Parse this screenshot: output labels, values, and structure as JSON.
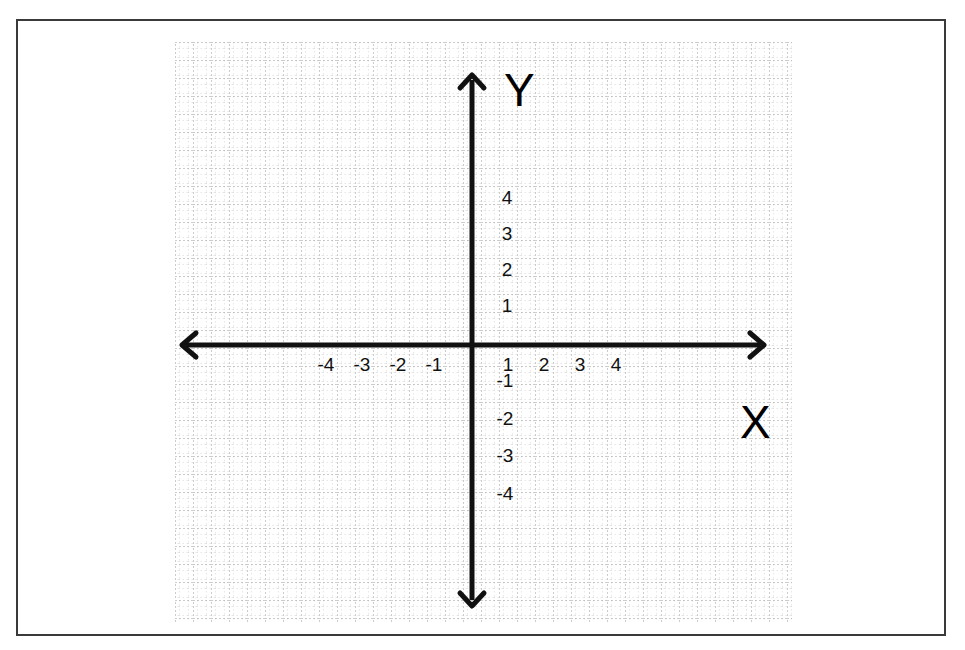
{
  "diagram": {
    "type": "cartesian-coordinate-plane",
    "axes": {
      "x_label": "X",
      "y_label": "Y",
      "x_ticks": [
        "-4",
        "-3",
        "-2",
        "-1",
        "1",
        "2",
        "3",
        "4"
      ],
      "y_ticks": [
        "4",
        "3",
        "2",
        "1",
        "-1",
        "-2",
        "-3",
        "-4"
      ],
      "arrows": "both-ends"
    },
    "grid": {
      "style": "dotted graph paper",
      "color": "#9a9a9a"
    },
    "colors": {
      "axis": "#111111",
      "frame": "#3a3a3a",
      "background": "#ffffff"
    }
  }
}
